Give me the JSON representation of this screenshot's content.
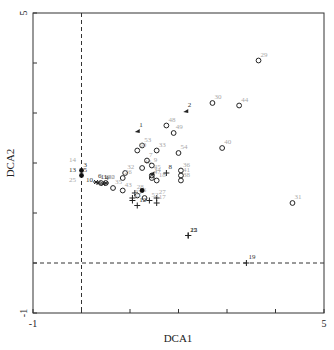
{
  "chart_data": {
    "type": "scatter",
    "title": "",
    "xlabel": "DCA1",
    "ylabel": "DCA2",
    "xlim": [
      -1,
      5
    ],
    "ylim": [
      -1,
      5
    ],
    "x_tick_labels": [
      "-1",
      "5"
    ],
    "y_tick_labels": [
      "-1",
      "5"
    ],
    "x_ticks": [
      -1,
      0,
      1,
      2,
      3,
      4,
      5
    ],
    "y_ticks": [
      -1,
      0,
      1,
      2,
      3,
      4,
      5
    ],
    "reference_lines": {
      "x": 0,
      "y": 0,
      "style": "dashed"
    },
    "grid": false,
    "legend": null,
    "series": [
      {
        "name": "circle",
        "marker": "open-circle",
        "points": [
          {
            "label": "29",
            "x": 3.65,
            "y": 4.05
          },
          {
            "label": "30",
            "x": 2.7,
            "y": 3.2
          },
          {
            "label": "44",
            "x": 3.25,
            "y": 3.15
          },
          {
            "label": "48",
            "x": 1.75,
            "y": 2.75
          },
          {
            "label": "49",
            "x": 1.9,
            "y": 2.6
          },
          {
            "label": "40",
            "x": 2.9,
            "y": 2.3
          },
          {
            "label": "53",
            "x": 1.25,
            "y": 2.35
          },
          {
            "label": "50",
            "x": 1.15,
            "y": 2.25
          },
          {
            "label": "33",
            "x": 1.55,
            "y": 2.25
          },
          {
            "label": "54",
            "x": 2.0,
            "y": 2.2
          },
          {
            "label": "46",
            "x": 1.25,
            "y": 1.9
          },
          {
            "label": "9",
            "x": 1.45,
            "y": 1.95
          },
          {
            "label": "7",
            "x": 1.35,
            "y": 2.05
          },
          {
            "label": "32",
            "x": 0.9,
            "y": 1.8
          },
          {
            "label": "34",
            "x": 1.45,
            "y": 1.75
          },
          {
            "label": "38",
            "x": 2.05,
            "y": 1.65
          },
          {
            "label": "36",
            "x": 2.05,
            "y": 1.85
          },
          {
            "label": "41",
            "x": 2.05,
            "y": 1.75
          },
          {
            "label": "26",
            "x": 0.85,
            "y": 1.7
          },
          {
            "label": "42",
            "x": 0.5,
            "y": 1.6
          },
          {
            "label": "18",
            "x": 1.55,
            "y": 1.65
          },
          {
            "label": "47",
            "x": 1.45,
            "y": 1.7
          },
          {
            "label": "35",
            "x": 0.65,
            "y": 1.5
          },
          {
            "label": "39",
            "x": 0.4,
            "y": 1.6
          },
          {
            "label": "43",
            "x": 0.85,
            "y": 1.45
          },
          {
            "label": "16",
            "x": 1.15,
            "y": 1.35
          },
          {
            "label": "31",
            "x": 4.35,
            "y": 1.2
          },
          {
            "label": "",
            "x": 1.3,
            "y": 1.3
          }
        ]
      },
      {
        "name": "triangle",
        "marker": "triangle",
        "points": [
          {
            "label": "1",
            "x": 1.15,
            "y": 2.65
          },
          {
            "label": "2",
            "x": 2.15,
            "y": 3.05
          },
          {
            "label": "45",
            "x": 1.45,
            "y": 1.8
          }
        ]
      },
      {
        "name": "plus",
        "marker": "plus",
        "points": [
          {
            "label": "8",
            "x": 1.75,
            "y": 1.8
          },
          {
            "label": "28",
            "x": 1.1,
            "y": 1.4
          },
          {
            "label": "21",
            "x": 1.05,
            "y": 1.25
          },
          {
            "label": "23",
            "x": 1.05,
            "y": 1.3
          },
          {
            "label": "27",
            "x": 1.55,
            "y": 1.3
          },
          {
            "label": "52",
            "x": 1.4,
            "y": 1.25
          },
          {
            "label": "17",
            "x": 1.55,
            "y": 1.2
          },
          {
            "label": "12",
            "x": 1.15,
            "y": 1.15
          },
          {
            "label": "15",
            "x": 2.2,
            "y": 0.55
          },
          {
            "label": "22",
            "x": 2.2,
            "y": 0.55
          },
          {
            "label": "19",
            "x": 3.4,
            "y": 0.0
          }
        ]
      },
      {
        "name": "filled",
        "marker": "filled-circle",
        "points": [
          {
            "label": "5",
            "x": 0.0,
            "y": 1.75
          },
          {
            "label": "3",
            "x": 0.0,
            "y": 1.85
          },
          {
            "label": "",
            "x": 1.25,
            "y": 1.45
          }
        ]
      },
      {
        "name": "star",
        "marker": "asterisk",
        "points": [
          {
            "label": "6",
            "x": 0.3,
            "y": 1.62
          },
          {
            "label": "11",
            "x": 0.35,
            "y": 1.6
          },
          {
            "label": "4",
            "x": 0.45,
            "y": 1.58
          },
          {
            "label": "20",
            "x": 0.5,
            "y": 1.6
          }
        ]
      },
      {
        "name": "labels-only",
        "marker": "none",
        "points": [
          {
            "label": "14",
            "x": -0.3,
            "y": 1.95
          },
          {
            "label": "13",
            "x": -0.3,
            "y": 1.75
          },
          {
            "label": "25",
            "x": -0.3,
            "y": 1.55
          },
          {
            "label": "10",
            "x": 0.05,
            "y": 1.55
          }
        ]
      }
    ]
  }
}
